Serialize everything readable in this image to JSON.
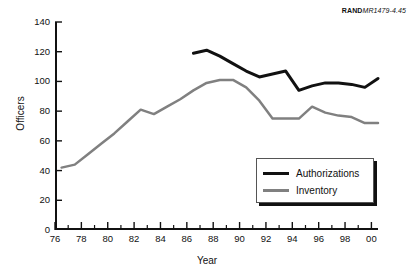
{
  "credit": {
    "bold_part": "RAND",
    "italic_part": "MR1479-4.45"
  },
  "chart_data": {
    "type": "line",
    "title": "",
    "subtitle": "",
    "xlabel": "Year",
    "ylabel": "Officers",
    "xlim": [
      76,
      100.5
    ],
    "ylim": [
      0,
      140
    ],
    "ytick_values": [
      0,
      20,
      40,
      60,
      80,
      100,
      120,
      140
    ],
    "ytick_labels": [
      "0",
      "20",
      "40",
      "60",
      "80",
      "100",
      "120",
      "140"
    ],
    "xtick_values": [
      76,
      78,
      80,
      82,
      84,
      86,
      88,
      90,
      92,
      94,
      96,
      98,
      100
    ],
    "xtick_labels": [
      "76",
      "78",
      "80",
      "82",
      "84",
      "86",
      "88",
      "90",
      "92",
      "94",
      "96",
      "98",
      "00"
    ],
    "xminor_values": [
      77,
      79,
      81,
      83,
      85,
      87,
      89,
      91,
      93,
      95,
      97,
      99
    ],
    "grid": false,
    "legend_position": "lower-right",
    "series": [
      {
        "name": "Authorizations",
        "color": "#111111",
        "linewidth": 3,
        "x": [
          86.5,
          87.5,
          88.5,
          89.5,
          90.5,
          91.5,
          92.5,
          93.5,
          94.5,
          95.5,
          96.5,
          97.5,
          98.5,
          99.5,
          100.5
        ],
        "values": [
          119,
          121,
          117,
          112,
          107,
          103,
          105,
          107,
          94,
          97,
          99,
          99,
          98,
          96,
          102
        ]
      },
      {
        "name": "Inventory",
        "color": "#808080",
        "linewidth": 2.5,
        "x": [
          76.5,
          77.5,
          78.5,
          79.5,
          80.5,
          81.5,
          82.5,
          83.5,
          84.5,
          85.5,
          86.5,
          87.5,
          88.5,
          89.5,
          90.5,
          91.5,
          92.5,
          93.5,
          94.5,
          95.5,
          96.5,
          97.5,
          98.5,
          99.5,
          100.5
        ],
        "values": [
          42,
          44,
          51,
          58,
          65,
          73,
          81,
          78,
          83,
          88,
          94,
          99,
          101,
          101,
          96,
          87,
          75,
          75,
          75,
          83,
          79,
          77,
          76,
          72,
          72
        ]
      }
    ]
  }
}
